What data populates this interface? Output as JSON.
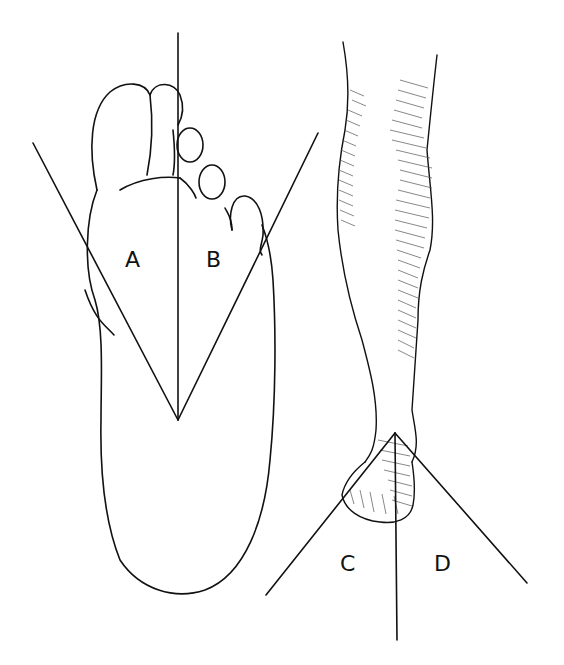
{
  "figure": {
    "left_panel": {
      "subject": "sole of foot",
      "labels": [
        "A",
        "B"
      ]
    },
    "right_panel": {
      "subject": "leg and foot, front view",
      "labels": [
        "C",
        "D"
      ]
    }
  },
  "labels": {
    "a": "A",
    "b": "B",
    "c": "C",
    "d": "D"
  },
  "colors": {
    "line": "#111111",
    "background": "#ffffff",
    "hatch": "#555555"
  }
}
